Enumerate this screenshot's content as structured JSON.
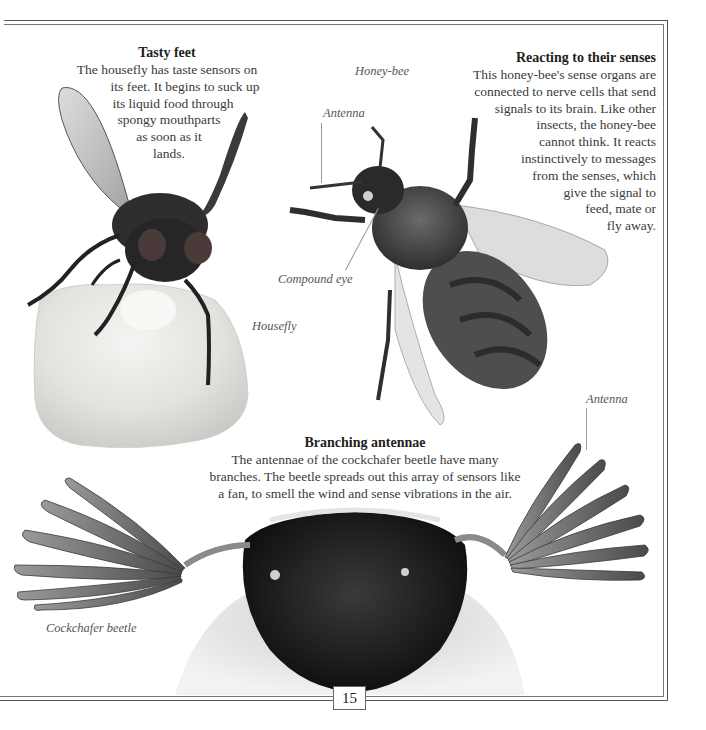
{
  "page": {
    "number": "15"
  },
  "sections": {
    "tasty_feet": {
      "heading": "Tasty feet",
      "lines": [
        "The housefly has taste sensors on",
        "its feet. It begins to suck up",
        "its liquid food through",
        "spongy mouthparts",
        "as soon as it",
        "lands."
      ]
    },
    "reacting": {
      "heading": "Reacting to their senses",
      "lines": [
        "This honey-bee's sense organs are",
        "connected to nerve cells that send",
        "signals to its brain. Like other",
        "insects, the honey-bee",
        "cannot think. It reacts",
        "instinctively to messages",
        "from the senses, which",
        "give the signal to",
        "feed, mate or",
        "fly away."
      ]
    },
    "branching": {
      "heading": "Branching antennae",
      "lines": [
        "The antennae of the cockchafer beetle have many",
        "branches. The beetle spreads out this array of sensors like",
        "a fan, to smell the wind and sense vibrations in the air."
      ]
    }
  },
  "labels": {
    "honey_bee": "Honey-bee",
    "bee_antenna": "Antenna",
    "compound_eye": "Compound eye",
    "housefly": "Housefly",
    "beetle_antenna": "Antenna",
    "cockchafer": "Cockchafer beetle"
  },
  "images": {
    "housefly": "housefly-on-sugar-cube-photo",
    "honey_bee": "honey-bee-photo",
    "cockchafer": "cockchafer-beetle-head-photo"
  }
}
